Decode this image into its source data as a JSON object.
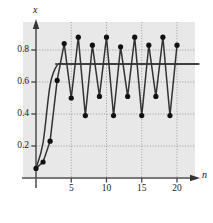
{
  "chart_data": {
    "type": "line",
    "title": "",
    "subtitle": "",
    "xlabel": "n",
    "ylabel": "x",
    "xlim": [
      -1.2,
      23.5
    ],
    "ylim": [
      -0.06,
      0.97
    ],
    "grid": true,
    "grid_style": "dotted",
    "legend": "none",
    "background": "#e8e8e8",
    "marker_color": "#111111",
    "line_color": "#333333",
    "xticks": [
      5,
      10,
      15,
      20
    ],
    "xtick_labels": [
      "5",
      "10",
      "15",
      "20"
    ],
    "yticks": [
      0.2,
      0.4,
      0.6,
      0.8
    ],
    "ytick_labels": [
      "0.2",
      "0.4",
      "0.6",
      "0.8"
    ],
    "series": [
      {
        "name": "convergent-trajectory",
        "style": "smooth-line-no-markers",
        "note": "settles to fixed point ~0.71",
        "x": [
          0,
          1,
          2,
          3,
          4,
          5,
          6,
          7,
          8,
          9,
          10,
          11,
          12,
          13,
          14,
          15,
          16,
          17,
          18,
          19,
          20,
          21,
          22,
          23
        ],
        "y": [
          0.06,
          0.22,
          0.58,
          0.705,
          0.712,
          0.712,
          0.712,
          0.712,
          0.712,
          0.712,
          0.712,
          0.712,
          0.712,
          0.712,
          0.712,
          0.712,
          0.712,
          0.712,
          0.712,
          0.712,
          0.712,
          0.712,
          0.712,
          0.712
        ]
      },
      {
        "name": "period-4-trajectory",
        "style": "line-with-round-markers",
        "note": "period-4 cycle between ~0.38 and ~0.88",
        "x": [
          0,
          1,
          2,
          3,
          4,
          5,
          6,
          7,
          8,
          9,
          10,
          11,
          12,
          13,
          14,
          15,
          16,
          17,
          18,
          19,
          20
        ],
        "y": [
          0.06,
          0.1,
          0.23,
          0.61,
          0.84,
          0.5,
          0.88,
          0.39,
          0.83,
          0.51,
          0.88,
          0.39,
          0.82,
          0.51,
          0.88,
          0.39,
          0.83,
          0.51,
          0.88,
          0.39,
          0.83
        ]
      }
    ],
    "horizontal_reference_line": {
      "name": "fixed-point-line",
      "y": 0.712,
      "x_from": 2.7,
      "x_to": 23.2
    }
  }
}
